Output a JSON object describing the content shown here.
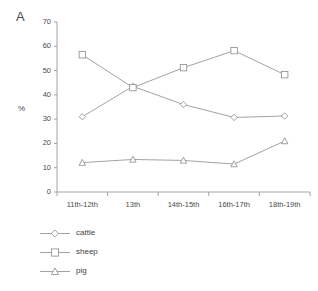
{
  "panel": {
    "label": "A"
  },
  "chart_data": {
    "type": "line",
    "title": "",
    "xlabel": "",
    "ylabel": "%",
    "ylim": [
      0,
      70
    ],
    "yticks": [
      0,
      10,
      20,
      30,
      40,
      50,
      60,
      70
    ],
    "grid": false,
    "legend_position": "below-left",
    "categories": [
      "11th-12th",
      "13th",
      "14th-15th",
      "16th-17th",
      "18th-19th"
    ],
    "series": [
      {
        "name": "cattle",
        "marker": "diamond",
        "values": [
          31.0,
          43.5,
          36.0,
          30.7,
          31.3
        ]
      },
      {
        "name": "sheep",
        "marker": "square",
        "values": [
          56.5,
          43.0,
          51.2,
          58.2,
          48.3
        ]
      },
      {
        "name": "pig",
        "marker": "triangle",
        "values": [
          12.1,
          13.4,
          13.0,
          11.5,
          21.0
        ]
      }
    ]
  },
  "legend": {
    "items": [
      {
        "label": "cattle",
        "marker": "diamond"
      },
      {
        "label": "sheep",
        "marker": "square"
      },
      {
        "label": "pig",
        "marker": "triangle"
      }
    ]
  },
  "colors": {
    "line": "#8a8a8a",
    "axis": "#9a9a9a",
    "text": "#3f3f3f"
  }
}
